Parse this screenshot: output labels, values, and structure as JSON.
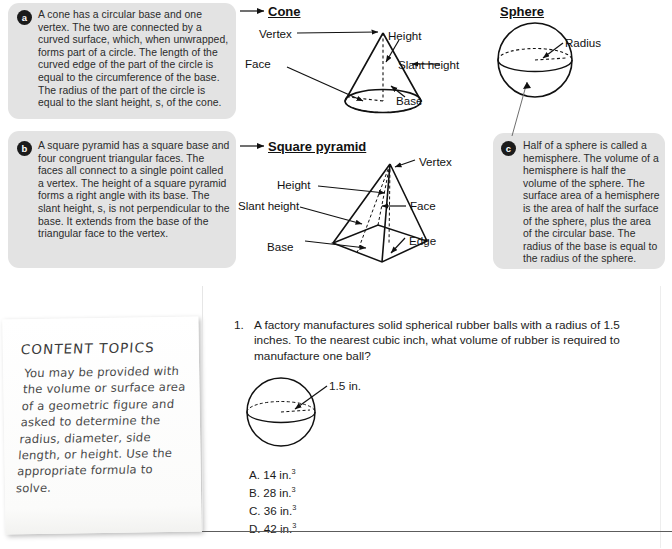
{
  "boxes": {
    "a": {
      "badge": "a",
      "text": "A cone has a circular base and one vertex. The two are connected by a curved surface, which, when unwrapped, forms part of a circle. The length of the curved edge of the part of the circle is equal to the circumference of the base. The radius of the part of the circle is equal to the slant height, s, of the cone."
    },
    "b": {
      "badge": "b",
      "text": "A square pyramid has a square base and four congruent triangular faces. The faces all connect to a single point called a vertex. The height of a square pyramid forms a right angle with its base. The slant height, s, is not perpendicular to the base. It extends from the base of the triangular face to the vertex."
    },
    "c": {
      "badge": "c",
      "text": "Half of a sphere is called a hemisphere. The volume of a hemisphere is half the volume of the sphere. The surface area of a hemisphere is the area of half the surface of the sphere, plus the area of the circular base. The radius of the base is equal to the radius of the sphere."
    }
  },
  "figures": {
    "cone": {
      "title": "Cone",
      "labels": {
        "vertex": "Vertex",
        "height": "Height",
        "face": "Face",
        "slant_height": "Slant height",
        "base": "Base"
      }
    },
    "sphere": {
      "title": "Sphere",
      "labels": {
        "radius": "Radius"
      }
    },
    "square_pyramid": {
      "title": "Square pyramid",
      "labels": {
        "vertex": "Vertex",
        "height": "Height",
        "slant_height": "Slant height",
        "face": "Face",
        "base": "Base",
        "edge": "Edge"
      }
    }
  },
  "note": {
    "title": "CONTENT TOPICS",
    "body": "You may be provided with the volume or surface area of a geometric figure and asked to determine the radius, diameter, side length, or height. Use the appropriate formula to solve."
  },
  "question": {
    "number": "1.",
    "text": "A factory manufactures solid spherical rubber balls with a radius of 1.5 inches. To the nearest cubic inch, what volume of rubber is required to manufacture one ball?",
    "diagram_label": "1.5 in.",
    "choices": [
      {
        "letter": "A.",
        "value": "14 in.",
        "exponent": "3"
      },
      {
        "letter": "B.",
        "value": "28 in.",
        "exponent": "3"
      },
      {
        "letter": "C.",
        "value": "36 in.",
        "exponent": "3"
      },
      {
        "letter": "D.",
        "value": "42 in.",
        "exponent": "3"
      }
    ]
  },
  "colors": {
    "panel_bg": "#e3e3e3",
    "badge_bg": "#1b1b1b",
    "ink": "#1c1c1c"
  }
}
